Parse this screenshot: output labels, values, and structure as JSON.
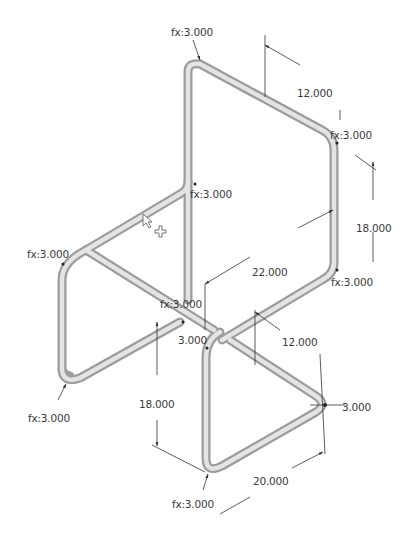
{
  "drawing": {
    "subject": "tubular chair frame sketch (isometric)",
    "colors": {
      "background": "#ffffff",
      "tube_outer": "#b9b9b9",
      "tube_inner": "#e6e6e6",
      "tube_edge": "#8a8a8a",
      "dimension_line": "#333333",
      "text": "#3a3a3a"
    },
    "fillet_labels": [
      {
        "id": "top-left",
        "text": "fx:3.000"
      },
      {
        "id": "top-right",
        "text": "fx:3.000"
      },
      {
        "id": "seat-back",
        "text": "fx:3.000"
      },
      {
        "id": "seat-left",
        "text": "fx:3.000"
      },
      {
        "id": "seat-right",
        "text": "fx:3.000"
      },
      {
        "id": "center",
        "text": "fx:3.000"
      },
      {
        "id": "bottom-left",
        "text": "fx:3.000"
      },
      {
        "id": "bottom-front",
        "text": "fx:3.000"
      }
    ],
    "dimensions": [
      {
        "id": "back-width",
        "text": "12.000"
      },
      {
        "id": "back-height",
        "text": "18.000"
      },
      {
        "id": "seat-depth",
        "text": "22.000"
      },
      {
        "id": "seat-width",
        "text": "12.000"
      },
      {
        "id": "center-radius",
        "text": "3.000"
      },
      {
        "id": "leg-height",
        "text": "18.000"
      },
      {
        "id": "front-radius",
        "text": "3.000"
      },
      {
        "id": "base-depth",
        "text": "20.000"
      }
    ]
  }
}
